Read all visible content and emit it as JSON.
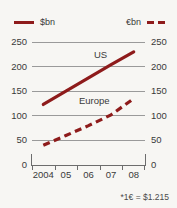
{
  "legend": {
    "entries": [
      {
        "label": "$bn",
        "style": "solid",
        "color": "#8e1b1b",
        "icon": "solid-line-icon"
      },
      {
        "label": "€bn",
        "style": "dashed",
        "color": "#8e1b1b",
        "icon": "dashed-line-icon"
      }
    ]
  },
  "footnote": "*1€ = $1.215",
  "colors": {
    "series": "#8e1b1b",
    "gridline": "#9a9a9a",
    "axis": "#6d6d6d",
    "text": "#3a3a3a",
    "background": "#f7f6f3"
  },
  "chart_data": {
    "type": "line",
    "title": "",
    "subtitle": "",
    "xlabel": "",
    "ylabel": "",
    "categories": [
      "2004",
      "05",
      "06",
      "07",
      "08"
    ],
    "x": [
      2004,
      2005,
      2006,
      2007,
      2008
    ],
    "ylim": [
      0,
      250
    ],
    "yticks": [
      0,
      50,
      100,
      150,
      200,
      250
    ],
    "ylim_right": [
      0,
      250
    ],
    "yticks_right": [
      0,
      50,
      100,
      150,
      200,
      250
    ],
    "grid": true,
    "legend_position": "top",
    "series": [
      {
        "name": "US",
        "unit": "$bn",
        "style": "solid",
        "color": "#8e1b1b",
        "values": [
          123,
          150,
          177,
          204,
          230
        ],
        "annotation": "US"
      },
      {
        "name": "Europe",
        "unit": "€bn",
        "style": "dashed",
        "color": "#8e1b1b",
        "values": [
          40,
          60,
          80,
          102,
          135
        ],
        "annotation": "Europe"
      }
    ],
    "annotations": [
      "US",
      "Europe",
      "*1€ = $1.215"
    ]
  }
}
